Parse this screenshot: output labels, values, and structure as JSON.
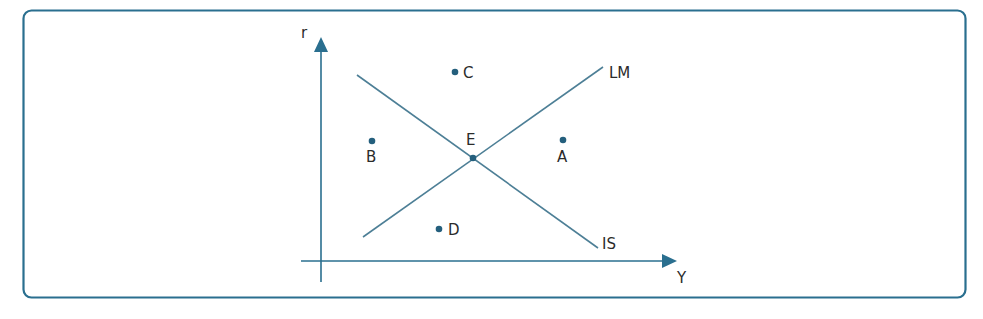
{
  "diagram": {
    "colors": {
      "frame": "#2a6f8f",
      "axis": "#2a6f8f",
      "curve": "#4d7f96",
      "point": "#245f7d",
      "text": "#2b2b2b",
      "background": "#ffffff"
    },
    "axes": {
      "y_label": "r",
      "x_label": "Y"
    },
    "curves": [
      {
        "id": "IS",
        "label": "IS",
        "from": [
          357,
          75
        ],
        "to": [
          598,
          248
        ],
        "slope": "downward"
      },
      {
        "id": "LM",
        "label": "LM",
        "from": [
          363,
          237
        ],
        "to": [
          603,
          67
        ],
        "slope": "upward"
      }
    ],
    "points": [
      {
        "id": "E",
        "label": "E",
        "x": 473,
        "y": 158,
        "note": "equilibrium at IS-LM intersection"
      },
      {
        "id": "C",
        "label": "C",
        "x": 455,
        "y": 72
      },
      {
        "id": "B",
        "label": "B",
        "x": 372,
        "y": 141
      },
      {
        "id": "A",
        "label": "A",
        "x": 563,
        "y": 140
      },
      {
        "id": "D",
        "label": "D",
        "x": 439,
        "y": 229
      }
    ]
  }
}
